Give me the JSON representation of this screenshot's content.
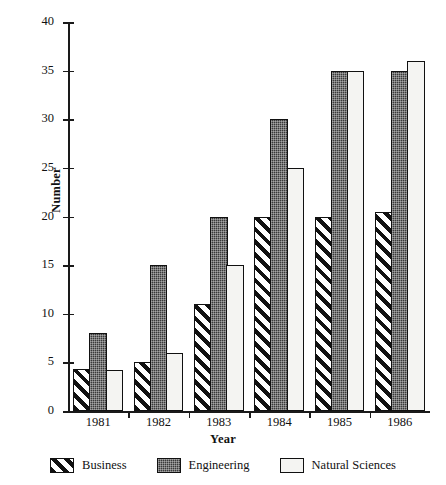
{
  "chart_data": {
    "type": "bar",
    "title": "",
    "xlabel": "Year",
    "ylabel": "Number",
    "categories": [
      "1981",
      "1982",
      "1983",
      "1984",
      "1985",
      "1986"
    ],
    "series": [
      {
        "name": "Business",
        "values": [
          4.3,
          5,
          11,
          20,
          20,
          20.5
        ],
        "pattern": "diagonal-hatch",
        "color": "#111111"
      },
      {
        "name": "Engineering",
        "values": [
          8,
          15,
          20,
          30,
          35,
          35
        ],
        "pattern": "dark-checker",
        "color": "#3a3a3a"
      },
      {
        "name": "Natural Sciences",
        "values": [
          4.2,
          6,
          15,
          25,
          35,
          36
        ],
        "pattern": "solid-light",
        "color": "#f4f4f2"
      }
    ],
    "ylim": [
      0,
      40
    ],
    "yticks": [
      0,
      5,
      10,
      15,
      20,
      25,
      30,
      35,
      40
    ],
    "ytick_labels": [
      "0",
      "5",
      "10",
      "15",
      "20",
      "25",
      "30",
      "35",
      "40"
    ],
    "grid": false,
    "legend_position": "bottom",
    "legend_entries": [
      "Business",
      "Engineering",
      "Natural Sciences"
    ]
  }
}
